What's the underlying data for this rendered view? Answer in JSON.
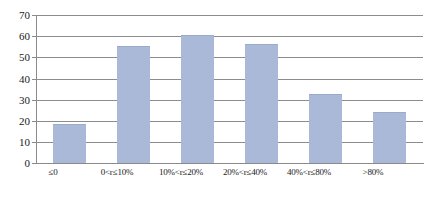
{
  "chart_data": {
    "type": "bar",
    "title": "",
    "subtitle": "",
    "xlabel": "",
    "ylabel": "",
    "categories": [
      "≤0",
      "0<r≤10%",
      "10%<r≤20%",
      "20%<r≤40%",
      "40%<r≤80%",
      ">80%"
    ],
    "values": [
      18.6,
      55.5,
      60.6,
      56.5,
      32.5,
      24.2
    ],
    "ylim": [
      0,
      70
    ],
    "ytick_labels": [
      "0",
      "10",
      "20",
      "30",
      "40",
      "50",
      "60",
      "70"
    ],
    "ytick_values": [
      0,
      10,
      20,
      30,
      40,
      50,
      60,
      70
    ],
    "grid": true,
    "legend": "none",
    "bar_color": "#a9b9d7",
    "axis_color": "#8a8a8a",
    "grid_color": "#8d8d8d",
    "background": "#ffffff"
  }
}
